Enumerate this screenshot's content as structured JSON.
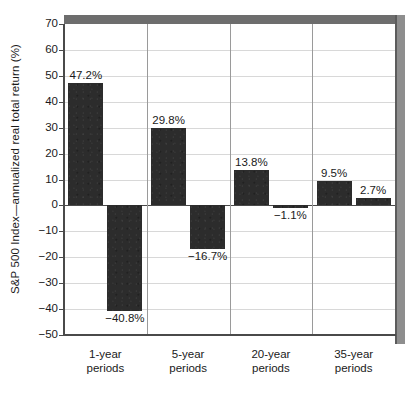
{
  "chart_data": {
    "type": "bar",
    "title": "",
    "xlabel": "",
    "ylabel": "S&P 500 Index—annualized real total return (%)",
    "ylim": [
      -50,
      70
    ],
    "ytick_step": 10,
    "grid": true,
    "legend": "none",
    "categories": [
      "1-year periods",
      "5-year periods",
      "20-year periods",
      "35-year periods"
    ],
    "series": [
      {
        "name": "best",
        "values": [
          47.2,
          29.8,
          13.8,
          9.5
        ],
        "labels": [
          "47.2%",
          "29.8%",
          "13.8%",
          "9.5%"
        ]
      },
      {
        "name": "worst",
        "values": [
          -40.8,
          -16.7,
          -1.1,
          2.7
        ],
        "labels": [
          "−40.8%",
          "−16.7%",
          "−1.1%",
          "2.7%"
        ]
      }
    ],
    "yticks": [
      {
        "value": 70,
        "label": "70"
      },
      {
        "value": 60,
        "label": "60"
      },
      {
        "value": 50,
        "label": "50"
      },
      {
        "value": 40,
        "label": "40"
      },
      {
        "value": 30,
        "label": "30"
      },
      {
        "value": 20,
        "label": "20"
      },
      {
        "value": 10,
        "label": "10"
      },
      {
        "value": 0,
        "label": "0"
      },
      {
        "value": -10,
        "label": "−10"
      },
      {
        "value": -20,
        "label": "−20"
      },
      {
        "value": -30,
        "label": "−30"
      },
      {
        "value": -40,
        "label": "−40"
      },
      {
        "value": -50,
        "label": "−50"
      }
    ],
    "xcategories": [
      {
        "line1": "1-year",
        "line2": "periods"
      },
      {
        "line1": "5-year",
        "line2": "periods"
      },
      {
        "line1": "20-year",
        "line2": "periods"
      },
      {
        "line1": "35-year",
        "line2": "periods"
      }
    ],
    "colors": {
      "bar": "#2c2c2c",
      "grid": "#d8d8d8",
      "axis": "#4a4a4a",
      "frame_top": "#6d6d6d",
      "frame_right": "#8e8e8e",
      "text": "#1a1a1a",
      "background": "#ffffff"
    }
  }
}
